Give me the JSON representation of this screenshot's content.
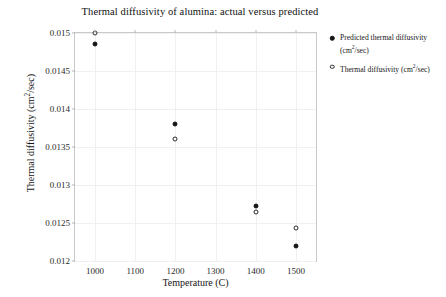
{
  "chart_data": {
    "type": "scatter",
    "title": "Thermal diffusivity of alumina: actual versus predicted",
    "xlabel": "Temperature (C)",
    "ylabel": "Thermal diffusivity (cm2/sec)",
    "xlim": [
      950,
      1550
    ],
    "ylim": [
      0.012,
      0.015
    ],
    "grid": true,
    "legend_position": "right",
    "xticks": [
      1000,
      1100,
      1200,
      1300,
      1400,
      1500
    ],
    "xtick_labels": [
      "1000",
      "1100",
      "1200",
      "1300",
      "1400",
      "1500"
    ],
    "yticks": [
      0.012,
      0.0125,
      0.013,
      0.0135,
      0.014,
      0.0145,
      0.015
    ],
    "ytick_labels": [
      "0.012",
      "0.0125",
      "0.013",
      "0.0135",
      "0.014",
      "0.0145",
      "0.015"
    ],
    "x": [
      1000,
      1200,
      1400,
      1500
    ],
    "series": [
      {
        "name": "Predicted thermal diffusivity (cm2/sec)",
        "marker": "filled-circle",
        "color": "#151515",
        "values": [
          0.01485,
          0.0138,
          0.01272,
          0.0122
        ]
      },
      {
        "name": "Thermal diffusivity (cm2/sec)",
        "marker": "open-circle",
        "color": "#2a2a2a",
        "values": [
          0.015,
          0.0136,
          0.01264,
          0.01243
        ]
      }
    ]
  },
  "legend": {
    "entries": [
      {
        "line1": "Predicted thermal diffusivity",
        "line2": "(cm",
        "sup": "2",
        "line3": "/sec)"
      },
      {
        "line1": "Thermal diffusivity (cm",
        "sup": "2",
        "line3": "/sec)"
      }
    ]
  },
  "axis": {
    "ylabel_prefix": "Thermal diffusivity (cm",
    "ylabel_sup": "2",
    "ylabel_suffix": "/sec)"
  }
}
